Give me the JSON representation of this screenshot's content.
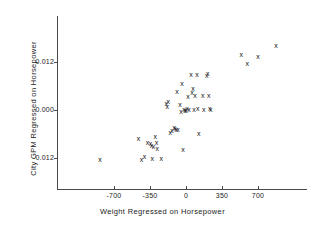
{
  "chart_data": {
    "type": "scatter",
    "title": "",
    "xlabel": "Weight Regressed on Horsepower",
    "ylabel": "City GPM Regressed on Horsepower",
    "marker": "x",
    "grid": false,
    "legend": null,
    "xlim": [
      -900,
      960
    ],
    "ylim": [
      -0.0165,
      0.0185
    ],
    "xticks": [
      -700,
      -350,
      0,
      350,
      700
    ],
    "xtick_labels": [
      "-700",
      "-350",
      "0",
      "350",
      "700"
    ],
    "yticks": [
      0.012,
      0.0,
      -0.012
    ],
    "ytick_labels": [
      "0.012",
      "0.000",
      "-0.012"
    ],
    "points": [
      {
        "x": -836,
        "y": -0.01225
      },
      {
        "x": -462,
        "y": -0.007
      },
      {
        "x": -433,
        "y": -0.01225
      },
      {
        "x": -404,
        "y": -0.0115
      },
      {
        "x": -375,
        "y": -0.008
      },
      {
        "x": -346,
        "y": -0.00825
      },
      {
        "x": -336,
        "y": -0.00875
      },
      {
        "x": -327,
        "y": -0.012
      },
      {
        "x": -317,
        "y": -0.009
      },
      {
        "x": -298,
        "y": -0.0065
      },
      {
        "x": -288,
        "y": -0.008
      },
      {
        "x": -279,
        "y": -0.0095
      },
      {
        "x": -240,
        "y": -0.012
      },
      {
        "x": -192,
        "y": 0.00175
      },
      {
        "x": -183,
        "y": 0.001
      },
      {
        "x": -173,
        "y": 0.00225
      },
      {
        "x": -154,
        "y": -0.0055
      },
      {
        "x": -135,
        "y": -0.005
      },
      {
        "x": -115,
        "y": -0.00425
      },
      {
        "x": -106,
        "y": -0.0045
      },
      {
        "x": -96,
        "y": -0.00475
      },
      {
        "x": -87,
        "y": 0.00475
      },
      {
        "x": -77,
        "y": -0.00475
      },
      {
        "x": -58,
        "y": 0.0015
      },
      {
        "x": -48,
        "y": -0.00025
      },
      {
        "x": -38,
        "y": 0.00675
      },
      {
        "x": -29,
        "y": -0.00975
      },
      {
        "x": -19,
        "y": 0.00025
      },
      {
        "x": -10,
        "y": 0.0
      },
      {
        "x": 0,
        "y": 0.0
      },
      {
        "x": 10,
        "y": 0.0005
      },
      {
        "x": 19,
        "y": 0.0035
      },
      {
        "x": 29,
        "y": 0.00025
      },
      {
        "x": 48,
        "y": 0.009
      },
      {
        "x": 58,
        "y": 0.0045
      },
      {
        "x": 67,
        "y": 0.0055
      },
      {
        "x": 77,
        "y": 0.00025
      },
      {
        "x": 87,
        "y": 0.00375
      },
      {
        "x": 106,
        "y": 0.009
      },
      {
        "x": 115,
        "y": 0.0005
      },
      {
        "x": 125,
        "y": -0.00575
      },
      {
        "x": 163,
        "y": 0.00375
      },
      {
        "x": 173,
        "y": 0.00025
      },
      {
        "x": 202,
        "y": 0.00875
      },
      {
        "x": 211,
        "y": 0.00925
      },
      {
        "x": 221,
        "y": 0.00375
      },
      {
        "x": 231,
        "y": 0.0005
      },
      {
        "x": 240,
        "y": 0.00025
      },
      {
        "x": 538,
        "y": 0.014
      },
      {
        "x": 596,
        "y": 0.01175
      },
      {
        "x": 701,
        "y": 0.0135
      },
      {
        "x": 874,
        "y": 0.01625
      }
    ]
  }
}
